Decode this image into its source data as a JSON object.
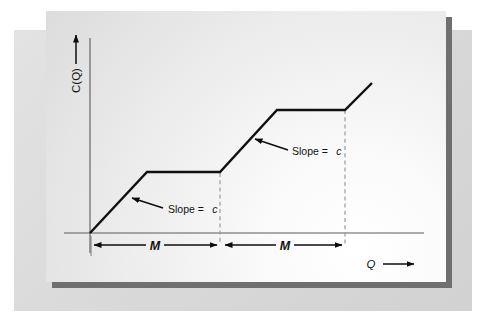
{
  "figure": {
    "y_axis": {
      "label": "C(Q)",
      "arrow": "up-arrow"
    },
    "x_axis": {
      "label": "Q",
      "arrow": "right-arrow"
    },
    "annotations": [
      {
        "id": "slope-1",
        "prefix": "Slope =",
        "symbol": "c"
      },
      {
        "id": "slope-2",
        "prefix": "Slope =",
        "symbol": "c"
      }
    ],
    "dimensions": [
      {
        "id": "dim-1",
        "label": "M"
      },
      {
        "id": "dim-2",
        "label": "M"
      }
    ],
    "colors": {
      "curve": "#101010",
      "axis": "#5a5a5a",
      "dashed_guide": "#9a9a9a",
      "dimension_arrow": "#0d0d0d",
      "mat_outer": "#dedede",
      "plate_shadow": "#6f6f6f"
    }
  },
  "chart_data": {
    "type": "line",
    "title": "",
    "xlabel": "Q",
    "ylabel": "C(Q)",
    "grid": false,
    "legend": null,
    "xlim": [
      0,
      4
    ],
    "ylim": [
      0,
      3
    ],
    "series": [
      {
        "name": "C(Q)",
        "x": [
          0.0,
          0.78,
          1.64,
          2.36,
          3.2,
          3.55
        ],
        "y": [
          0.0,
          0.76,
          0.76,
          1.56,
          1.56,
          1.9
        ],
        "points_px": [
          [
            90,
            233
          ],
          [
            147,
            172
          ],
          [
            220,
            172
          ],
          [
            277,
            110
          ],
          [
            345,
            110
          ],
          [
            372,
            83
          ]
        ]
      }
    ],
    "guides": [
      {
        "type": "vertical-dashed",
        "x": 1.64,
        "x_px": 220,
        "from_px": 173,
        "to_px": 245
      },
      {
        "type": "vertical-dashed",
        "x": 3.2,
        "x_px": 345,
        "from_px": 110,
        "to_px": 245
      }
    ],
    "annotations": [
      {
        "text": "Slope = c",
        "points_to_px": [
          130,
          200
        ],
        "text_at_px": [
          172,
          212
        ]
      },
      {
        "text": "Slope = c",
        "points_to_px": [
          252,
          140
        ],
        "text_at_px": [
          273,
          153
        ]
      }
    ],
    "dimension_spans": [
      {
        "label": "M",
        "from_x": 0.0,
        "to_x": 1.64,
        "from_px": 91,
        "to_px": 219,
        "y_px": 245
      },
      {
        "label": "M",
        "from_x": 1.64,
        "to_x": 3.2,
        "from_px": 222,
        "to_px": 344,
        "y_px": 245
      }
    ]
  }
}
